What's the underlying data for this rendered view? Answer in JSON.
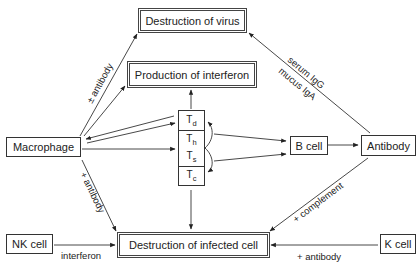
{
  "nodes": {
    "destruction_of_virus": "Destruction of virus",
    "production_of_interferon": "Production of interferon",
    "macrophage": "Macrophage",
    "t_cells": [
      {
        "base": "T",
        "sub": "d"
      },
      {
        "base": "T",
        "sub": "h"
      },
      {
        "base": "T",
        "sub": "s"
      },
      {
        "base": "T",
        "sub": "c"
      }
    ],
    "b_cell": "B cell",
    "antibody": "Antibody",
    "nk_cell": "NK cell",
    "destruction_of_infected_cell": "Destruction of infected cell",
    "k_cell": "K cell"
  },
  "edge_labels": {
    "macrophage_to_virus": "± antibody",
    "antibody_to_virus_1": "serum IgG",
    "antibody_to_virus_2": "mucus IgA",
    "macrophage_to_infected": "+ antibody",
    "antibody_to_infected": "+ complement",
    "nk_to_infected": "interferon",
    "k_to_infected": "+ antibody"
  }
}
